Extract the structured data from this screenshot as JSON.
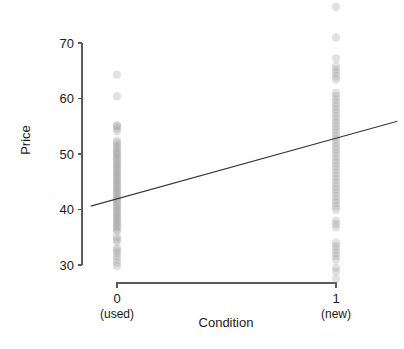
{
  "chart_data": {
    "type": "scatter",
    "title": "",
    "xlabel": "Condition",
    "ylabel": "Price",
    "xlim": [
      -0.12,
      1.28
    ],
    "ylim": [
      27.0,
      71.5
    ],
    "grid": false,
    "legend": null,
    "x_tick_values": [
      0,
      1
    ],
    "x_tick_labels": [
      "0",
      "1"
    ],
    "x_tick_sublabels": [
      "(used)",
      "(new)"
    ],
    "y_tick_values": [
      30,
      40,
      50,
      60,
      70
    ],
    "y_tick_labels": [
      "30",
      "40",
      "50",
      "60",
      "70"
    ],
    "point_color": "#9a9a9a",
    "point_opacity": 0.3,
    "point_radius": 4.2,
    "line_color": "#3a3a3a",
    "axis_color": "#5a5a5a",
    "fit_line": {
      "name": "regression line",
      "x": [
        -0.12,
        1.28
      ],
      "y": [
        40.6,
        55.9
      ],
      "intercept": 41.9,
      "slope": 10.9
    },
    "series": [
      {
        "name": "Condition = 0 (used)",
        "x_value": 0,
        "values": [
          64.3,
          60.4,
          55.2,
          55.0,
          54.6,
          54.1,
          52.4,
          52.0,
          51.6,
          51.2,
          50.8,
          50.4,
          50.1,
          49.8,
          49.4,
          49.0,
          48.7,
          48.3,
          48.0,
          47.6,
          47.3,
          46.9,
          46.6,
          46.2,
          45.9,
          45.5,
          45.2,
          44.8,
          44.5,
          44.1,
          43.8,
          43.4,
          43.1,
          42.7,
          42.4,
          42.0,
          41.7,
          41.3,
          41.0,
          40.6,
          40.3,
          39.9,
          39.6,
          39.2,
          38.9,
          38.5,
          38.2,
          37.8,
          37.5,
          37.1,
          36.8,
          36.4,
          36.1,
          35.0,
          34.6,
          34.2,
          33.0,
          32.6,
          32.2,
          31.6,
          31.0,
          30.4,
          29.8
        ]
      },
      {
        "name": "Condition = 1 (new)",
        "x_value": 1,
        "values": [
          76.5,
          71.0,
          67.2,
          65.8,
          65.2,
          64.6,
          64.0,
          63.4,
          61.0,
          60.4,
          59.8,
          59.2,
          58.6,
          58.0,
          57.4,
          56.8,
          56.2,
          55.6,
          55.0,
          54.4,
          53.8,
          53.2,
          52.6,
          52.0,
          51.4,
          50.8,
          50.2,
          49.6,
          49.0,
          48.4,
          47.8,
          47.2,
          46.6,
          46.0,
          45.4,
          44.8,
          44.2,
          43.6,
          43.0,
          42.4,
          41.8,
          41.2,
          40.6,
          40.0,
          38.0,
          37.4,
          36.8,
          34.0,
          33.4,
          32.8,
          32.2,
          31.6,
          31.0,
          29.5,
          28.8,
          27.5
        ]
      }
    ]
  }
}
